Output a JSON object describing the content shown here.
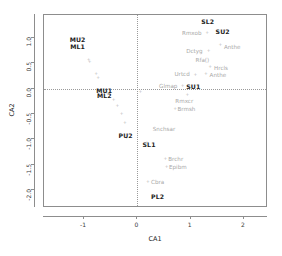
{
  "chart_data": {
    "type": "scatter",
    "title": "",
    "xlabel": "CA1",
    "ylabel": "CA2",
    "xlim": [
      -1.75,
      2.45
    ],
    "ylim": [
      -2.35,
      1.45
    ],
    "xticks": [
      -1,
      0,
      1,
      2
    ],
    "xticklabels": [
      "-1",
      "0",
      "1",
      "2"
    ],
    "yticks": [
      1.0,
      0.5,
      0.0,
      -0.5,
      -1.0,
      -1.5,
      -2.0
    ],
    "yticklabels": [
      "1.0",
      "0.5",
      "0.0",
      "-0.5",
      "-1.0",
      "-1.5",
      "-2.0"
    ],
    "grid": false,
    "legend": null,
    "reference_lines": [
      {
        "axis": "vertical",
        "value": 0,
        "style": "dotted"
      },
      {
        "axis": "horizontal",
        "value": 0,
        "style": "dotted"
      }
    ],
    "series": [
      {
        "name": "sites",
        "style": "bold-text",
        "points": [
          {
            "label": "MU2",
            "x": -1.12,
            "y": 0.97,
            "marker": false
          },
          {
            "label": "ML1",
            "x": -1.12,
            "y": 0.84,
            "marker": false
          },
          {
            "label": "MU1",
            "x": -0.62,
            "y": -0.02,
            "marker": false
          },
          {
            "label": "ML2",
            "x": -0.62,
            "y": -0.13,
            "marker": false
          },
          {
            "label": "PU2",
            "x": -0.22,
            "y": -0.92,
            "marker": false
          },
          {
            "label": "SL1",
            "x": 0.22,
            "y": -1.09,
            "marker": false
          },
          {
            "label": "PL2",
            "x": 0.38,
            "y": -2.12,
            "marker": false
          },
          {
            "label": "SL2",
            "x": 1.32,
            "y": 1.33,
            "marker": false
          },
          {
            "label": "SU2",
            "x": 1.6,
            "y": 1.14,
            "marker": false
          },
          {
            "label": "SU1",
            "x": 1.05,
            "y": 0.05,
            "marker": false
          }
        ]
      },
      {
        "name": "species",
        "style": "grey-text",
        "points": [
          {
            "label": "Rmxob",
            "x": 1.02,
            "y": 1.1,
            "marker": true,
            "mx": 1.3,
            "my": 1.1
          },
          {
            "label": "Dctyg",
            "x": 1.07,
            "y": 0.74,
            "marker": true,
            "mx": 1.33,
            "my": 0.75
          },
          {
            "label": "Anthe",
            "x": 1.78,
            "y": 0.82,
            "marker": true,
            "mx": 1.55,
            "my": 0.86
          },
          {
            "label": "Rfa()",
            "x": 1.22,
            "y": 0.57,
            "marker": false
          },
          {
            "label": "Hrcls",
            "x": 1.57,
            "y": 0.41,
            "marker": true,
            "mx": 1.36,
            "my": 0.44
          },
          {
            "label": "Urtcd",
            "x": 0.84,
            "y": 0.28,
            "marker": true,
            "mx": 1.08,
            "my": 0.28
          },
          {
            "label": "Anthe",
            "x": 1.51,
            "y": 0.27,
            "marker": true,
            "mx": 1.28,
            "my": 0.3
          },
          {
            "label": "Glmap",
            "x": 0.58,
            "y": 0.06,
            "marker": true,
            "mx": 0.84,
            "my": 0.06
          },
          {
            "label": "Rmxcr",
            "x": 0.88,
            "y": -0.24,
            "marker": true,
            "mx": 0.93,
            "my": -0.12
          },
          {
            "label": "Brmsh",
            "x": 0.92,
            "y": -0.41,
            "marker": true,
            "mx": 0.7,
            "my": -0.4
          },
          {
            "label": "Snchsar",
            "x": 0.5,
            "y": -0.8,
            "marker": false
          },
          {
            "label": "Brchr",
            "x": 0.72,
            "y": -1.38,
            "marker": true,
            "mx": 0.52,
            "my": -1.37
          },
          {
            "label": "Epibm",
            "x": 0.76,
            "y": -1.55,
            "marker": true,
            "mx": 0.54,
            "my": -1.54
          },
          {
            "label": "Cbra",
            "x": 0.38,
            "y": -1.83,
            "marker": true,
            "mx": 0.19,
            "my": -1.83
          }
        ]
      },
      {
        "name": "unlabeled-points",
        "style": "marker-only",
        "points": [
          {
            "label": "",
            "x": -0.92,
            "y": 0.58,
            "marker": true
          },
          {
            "label": "",
            "x": -0.9,
            "y": 0.53,
            "marker": true
          },
          {
            "label": "",
            "x": -0.78,
            "y": 0.3,
            "marker": true
          },
          {
            "label": "",
            "x": -0.74,
            "y": 0.21,
            "marker": true
          },
          {
            "label": "",
            "x": -0.58,
            "y": -0.07,
            "marker": true
          },
          {
            "label": "",
            "x": -0.45,
            "y": -0.22,
            "marker": true
          },
          {
            "label": "",
            "x": -0.38,
            "y": -0.33,
            "marker": true
          },
          {
            "label": "",
            "x": -0.3,
            "y": -0.48,
            "marker": true
          },
          {
            "label": "",
            "x": -0.24,
            "y": -0.66,
            "marker": true
          },
          {
            "label": "",
            "x": -0.21,
            "y": -0.96,
            "marker": true
          },
          {
            "label": "",
            "x": 0.05,
            "y": -0.05,
            "marker": true
          },
          {
            "label": "",
            "x": 1.22,
            "y": 1.31,
            "marker": true
          },
          {
            "label": "",
            "x": 1.5,
            "y": 1.12,
            "marker": true
          },
          {
            "label": "",
            "x": 0.97,
            "y": 0.02,
            "marker": true
          },
          {
            "label": "",
            "x": 0.17,
            "y": -1.06,
            "marker": true
          }
        ]
      }
    ]
  }
}
